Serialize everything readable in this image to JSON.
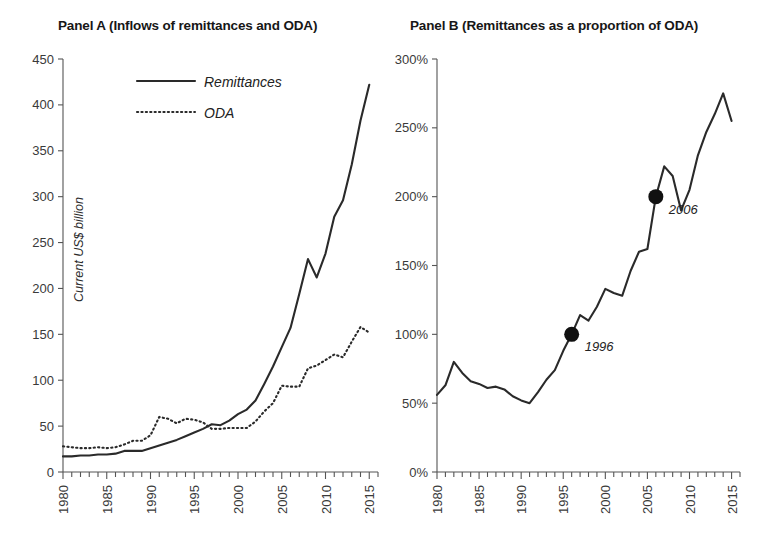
{
  "figure": {
    "background": "#ffffff",
    "ink_color": "#2a2a2a"
  },
  "panel_a": {
    "title": "Panel A (Inflows of remittances and ODA)",
    "ylabel": "Current US$ billion",
    "legend": [
      {
        "label": "Remittances",
        "style": "solid"
      },
      {
        "label": "ODA",
        "style": "dotted"
      }
    ]
  },
  "panel_b": {
    "title": "Panel B (Remittances as a proportion of ODA)",
    "annotations": [
      {
        "label": "1996",
        "x": 1996,
        "y": 100
      },
      {
        "label": "2006",
        "x": 2006,
        "y": 200
      }
    ]
  },
  "chart_data": [
    {
      "type": "line",
      "title": "Panel A (Inflows of remittances and ODA)",
      "xlabel": "",
      "ylabel": "Current US$ billion",
      "xlim": [
        1980,
        2016
      ],
      "ylim": [
        0,
        450
      ],
      "ytick_labels": [
        "0",
        "50",
        "100",
        "150",
        "200",
        "250",
        "300",
        "350",
        "400",
        "450"
      ],
      "ytick_values": [
        0,
        50,
        100,
        150,
        200,
        250,
        300,
        350,
        400,
        450
      ],
      "xtick_labels": [
        "1980",
        "1985",
        "1990",
        "1995",
        "2000",
        "2005",
        "2010",
        "2015"
      ],
      "xtick_values": [
        1980,
        1985,
        1990,
        1995,
        2000,
        2005,
        2010,
        2015
      ],
      "grid": false,
      "legend_position": "upper-left-inside",
      "x": [
        1980,
        1981,
        1982,
        1983,
        1984,
        1985,
        1986,
        1987,
        1988,
        1989,
        1990,
        1991,
        1992,
        1993,
        1994,
        1995,
        1996,
        1997,
        1998,
        1999,
        2000,
        2001,
        2002,
        2003,
        2004,
        2005,
        2006,
        2007,
        2008,
        2009,
        2010,
        2011,
        2012,
        2013,
        2014,
        2015
      ],
      "series": [
        {
          "name": "Remittances",
          "style": "solid",
          "values": [
            17,
            17,
            18,
            18,
            19,
            19,
            20,
            23,
            23,
            23,
            26,
            29,
            32,
            35,
            39,
            43,
            47,
            52,
            51,
            56,
            63,
            68,
            78,
            96,
            115,
            136,
            157,
            194,
            232,
            212,
            238,
            278,
            296,
            335,
            383,
            422
          ]
        },
        {
          "name": "ODA",
          "style": "dotted",
          "values": [
            28,
            27,
            26,
            26,
            27,
            26,
            27,
            30,
            34,
            34,
            40,
            60,
            58,
            53,
            58,
            57,
            54,
            47,
            47,
            48,
            48,
            48,
            55,
            66,
            75,
            94,
            93,
            93,
            113,
            116,
            122,
            128,
            125,
            142,
            158,
            152
          ]
        }
      ]
    },
    {
      "type": "line",
      "title": "Panel B (Remittances as a proportion of ODA)",
      "xlabel": "",
      "ylabel": "",
      "xlim": [
        1980,
        2016
      ],
      "ylim": [
        0,
        300
      ],
      "ytick_labels": [
        "0%",
        "50%",
        "100%",
        "150%",
        "200%",
        "250%",
        "300%"
      ],
      "ytick_values": [
        0,
        50,
        100,
        150,
        200,
        250,
        300
      ],
      "xtick_labels": [
        "1980",
        "1985",
        "1990",
        "1995",
        "2000",
        "2005",
        "2010",
        "2015"
      ],
      "xtick_values": [
        1980,
        1985,
        1990,
        1995,
        2000,
        2005,
        2010,
        2015
      ],
      "grid": false,
      "legend_position": "none",
      "x": [
        1980,
        1981,
        1982,
        1983,
        1984,
        1985,
        1986,
        1987,
        1988,
        1989,
        1990,
        1991,
        1992,
        1993,
        1994,
        1995,
        1996,
        1997,
        1998,
        1999,
        2000,
        2001,
        2002,
        2003,
        2004,
        2005,
        2006,
        2007,
        2008,
        2009,
        2010,
        2011,
        2012,
        2013,
        2014,
        2015
      ],
      "series": [
        {
          "name": "Remittances as a proportion of ODA",
          "style": "solid",
          "values": [
            56,
            63,
            80,
            72,
            66,
            64,
            61,
            62,
            60,
            55,
            52,
            50,
            58,
            67,
            74,
            88,
            100,
            114,
            110,
            120,
            133,
            130,
            128,
            146,
            160,
            162,
            200,
            222,
            215,
            190,
            205,
            230,
            247,
            260,
            275,
            255
          ]
        }
      ],
      "markers": [
        {
          "label": "1996",
          "x": 1996,
          "y": 100
        },
        {
          "label": "2006",
          "x": 2006,
          "y": 200
        }
      ]
    }
  ]
}
